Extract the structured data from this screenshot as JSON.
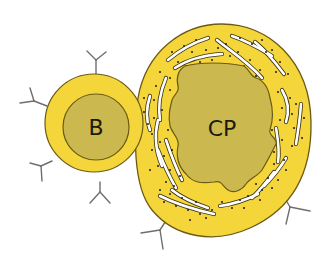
{
  "diagram": {
    "colors": {
      "cytoplasm": "#f5d63a",
      "nucleus": "#cbb84e",
      "outline": "#6b5a14",
      "antibody": "#6e6e6e",
      "er_lumen": "#ffffff",
      "ribosome": "#1c1c1c"
    },
    "cells": [
      {
        "id": "b-cell",
        "label": "B",
        "type": "circle",
        "has_surface_antibodies": true
      },
      {
        "id": "plasma-cell",
        "label": "CP",
        "type": "ellipse",
        "has_rough_er": true,
        "has_surface_antibodies": true
      }
    ]
  }
}
